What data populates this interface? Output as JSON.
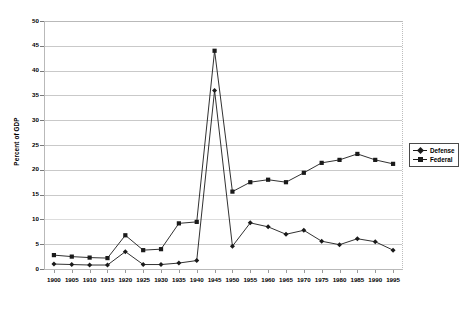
{
  "chart_data": {
    "type": "line",
    "title": "",
    "xlabel": "",
    "ylabel": "Percent of GDP",
    "ylim": [
      0,
      50
    ],
    "ytick_step": 5,
    "grid": true,
    "legend_position": "right",
    "categories": [
      "1900",
      "1905",
      "1910",
      "1915",
      "1920",
      "1925",
      "1930",
      "1935",
      "1940",
      "1945",
      "1950",
      "1955",
      "1960",
      "1965",
      "1970",
      "1975",
      "1980",
      "1985",
      "1990",
      "1995"
    ],
    "yticks": [
      "0",
      "5",
      "10",
      "15",
      "20",
      "25",
      "30",
      "35",
      "40",
      "45",
      "50"
    ],
    "series": [
      {
        "name": "Defense",
        "marker": "diamond",
        "color": "#1a1a1a",
        "values": [
          1.0,
          0.9,
          0.8,
          0.8,
          3.5,
          0.9,
          0.9,
          1.2,
          1.7,
          36.0,
          4.6,
          9.3,
          8.5,
          7.0,
          7.8,
          5.6,
          4.9,
          6.1,
          5.5,
          3.8
        ]
      },
      {
        "name": "Federal",
        "marker": "square",
        "color": "#1a1a1a",
        "values": [
          2.8,
          2.5,
          2.3,
          2.2,
          6.8,
          3.8,
          4.0,
          9.2,
          9.5,
          44.0,
          15.6,
          17.5,
          18.0,
          17.5,
          19.4,
          21.4,
          22.0,
          23.2,
          22.0,
          21.2
        ]
      }
    ]
  },
  "legend": {
    "items": [
      {
        "label": "Defense",
        "marker": "diamond"
      },
      {
        "label": "Federal",
        "marker": "square"
      }
    ]
  },
  "axes": {
    "y_axis_title": "Percent of GDP"
  }
}
